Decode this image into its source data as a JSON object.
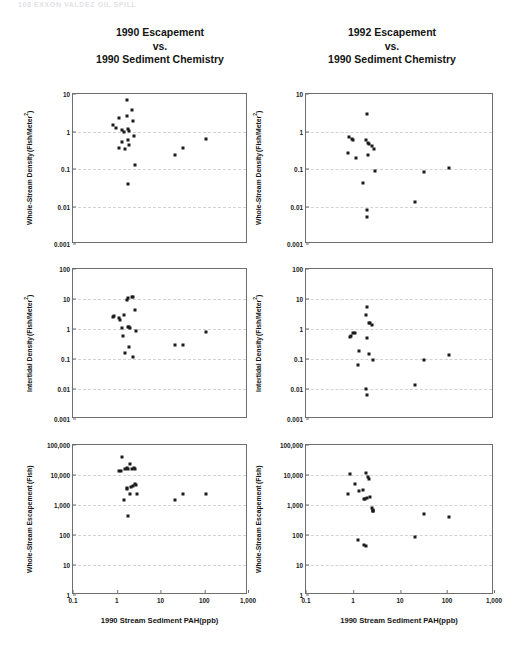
{
  "running_head": "108    EXXON VALDEZ OIL SPILL",
  "columns": [
    {
      "title_lines": [
        "1990 Escapement",
        "vs.",
        "1990  Sediment Chemistry"
      ]
    },
    {
      "title_lines": [
        "1992 Escapement",
        "vs.",
        "1990 Sediment Chemistry"
      ]
    }
  ],
  "axis": {
    "x_label_left": "1990 Stream Sediment PAH(ppb)",
    "x_label_right": "1990 Stream Sediment  PAH(ppb)",
    "x_ticks": [
      "0.1",
      "1",
      "10",
      "100",
      "1,000"
    ],
    "y_ticks_density": [
      "10",
      "1",
      "0.1",
      "0.01",
      "0.001"
    ],
    "y_ticks_intertidal": [
      "100",
      "10",
      "1",
      "0.1",
      "0.01",
      "0.001"
    ],
    "y_ticks_escapement": [
      "100,000",
      "10,000",
      "1,000",
      "100",
      "10",
      "1"
    ]
  },
  "chart_data": [
    {
      "id": "whole-stream-density-1990",
      "type": "scatter",
      "title": "1990 Escapement vs. 1990 Sediment Chemistry",
      "xlabel": "1990 Stream Sediment PAH(ppb)",
      "ylabel": "Whole-Stream Density (Fish/Meter²)",
      "ylabel_line1": "Whole-Stream Density",
      "ylabel_line2": "(Fish/Meter²)",
      "xscale": "log",
      "yscale": "log",
      "xlim": [
        0.1,
        1000
      ],
      "ylim": [
        0.001,
        10
      ],
      "grid": true,
      "points": [
        [
          1.75,
          7.0
        ],
        [
          2.2,
          3.7
        ],
        [
          1.15,
          2.3
        ],
        [
          1.7,
          2.6
        ],
        [
          2.35,
          1.9
        ],
        [
          0.82,
          1.5
        ],
        [
          0.95,
          1.25
        ],
        [
          1.35,
          1.1
        ],
        [
          1.8,
          1.15
        ],
        [
          1.9,
          1.05
        ],
        [
          1.5,
          0.98
        ],
        [
          2.5,
          0.78
        ],
        [
          1.3,
          0.52
        ],
        [
          1.85,
          0.58
        ],
        [
          1.95,
          0.44
        ],
        [
          1.15,
          0.37
        ],
        [
          1.55,
          0.35
        ],
        [
          2.6,
          0.13
        ],
        [
          1.8,
          0.04
        ],
        [
          21.0,
          0.23
        ],
        [
          32.0,
          0.36
        ],
        [
          110.0,
          0.62
        ]
      ]
    },
    {
      "id": "intertidal-density-1990",
      "type": "scatter",
      "title": "1990 Escapement vs. 1990 Sediment Chemistry",
      "xlabel": "1990 Stream Sediment PAH(ppb)",
      "ylabel": "Intertidal Density (Fish/Meter²)",
      "ylabel_line1": "Intertidal Density",
      "ylabel_line2": "(Fish/Meter²)",
      "xscale": "log",
      "yscale": "log",
      "xlim": [
        0.1,
        1000
      ],
      "ylim": [
        0.001,
        100
      ],
      "grid": true,
      "points": [
        [
          1.8,
          10.5
        ],
        [
          1.75,
          9.3
        ],
        [
          2.2,
          11.5
        ],
        [
          2.3,
          11.8
        ],
        [
          2.6,
          4.2
        ],
        [
          0.82,
          2.6
        ],
        [
          0.88,
          2.7
        ],
        [
          1.1,
          2.3
        ],
        [
          1.45,
          2.9
        ],
        [
          1.2,
          1.95
        ],
        [
          1.35,
          1.05
        ],
        [
          1.9,
          1.15
        ],
        [
          2.0,
          1.1
        ],
        [
          1.85,
          1.2
        ],
        [
          2.8,
          0.88
        ],
        [
          1.4,
          0.6
        ],
        [
          1.55,
          0.16
        ],
        [
          1.95,
          0.26
        ],
        [
          2.4,
          0.115
        ],
        [
          21.0,
          0.3
        ],
        [
          32.0,
          0.3
        ],
        [
          110.0,
          0.8
        ]
      ]
    },
    {
      "id": "whole-stream-escapement-1990",
      "type": "scatter",
      "title": "1990 Escapement vs. 1990 Sediment Chemistry",
      "xlabel": "1990 Stream Sediment PAH(ppb)",
      "ylabel": "Whole-Stream Escapement (Fish)",
      "ylabel_line1": "Whole-Stream Escapement",
      "ylabel_line2": "(Fish)",
      "xscale": "log",
      "yscale": "log",
      "xlim": [
        0.1,
        1000
      ],
      "ylim": [
        1,
        100000
      ],
      "grid": true,
      "points": [
        [
          1.35,
          39000
        ],
        [
          2.05,
          24000
        ],
        [
          1.15,
          13500
        ],
        [
          1.25,
          14000
        ],
        [
          1.55,
          16000
        ],
        [
          1.7,
          17500
        ],
        [
          1.85,
          15500
        ],
        [
          2.2,
          16000
        ],
        [
          2.45,
          17000
        ],
        [
          2.55,
          15500
        ],
        [
          1.7,
          3600
        ],
        [
          1.75,
          3400
        ],
        [
          2.1,
          4000
        ],
        [
          2.3,
          4400
        ],
        [
          2.65,
          5000
        ],
        [
          2.7,
          4700
        ],
        [
          2.05,
          2300
        ],
        [
          2.9,
          2350
        ],
        [
          1.5,
          1450
        ],
        [
          1.8,
          420
        ],
        [
          21.0,
          1500
        ],
        [
          32.0,
          2300
        ],
        [
          110.0,
          2250
        ]
      ]
    },
    {
      "id": "whole-stream-density-1992",
      "type": "scatter",
      "title": "1992 Escapement vs. 1990 Sediment Chemistry",
      "xlabel": "1990 Stream Sediment PAH(ppb)",
      "ylabel": "Whole-Stream Density (Fish/Meter²)",
      "ylabel_line1": "Whole-Stream Density",
      "ylabel_line2": "(Fish/Meter²)",
      "xscale": "log",
      "yscale": "log",
      "xlim": [
        0.1,
        1000
      ],
      "ylim": [
        0.001,
        10
      ],
      "grid": true,
      "points": [
        [
          2.0,
          2.9
        ],
        [
          0.82,
          0.72
        ],
        [
          0.95,
          0.62
        ],
        [
          1.02,
          0.6
        ],
        [
          1.9,
          0.58
        ],
        [
          2.1,
          0.5
        ],
        [
          2.2,
          0.46
        ],
        [
          2.5,
          0.42
        ],
        [
          2.75,
          0.35
        ],
        [
          0.78,
          0.26
        ],
        [
          1.15,
          0.2
        ],
        [
          2.05,
          0.23
        ],
        [
          2.95,
          0.088
        ],
        [
          1.6,
          0.043
        ],
        [
          2.0,
          0.0082
        ],
        [
          1.95,
          0.0053
        ],
        [
          21.0,
          0.0128
        ],
        [
          32.0,
          0.081
        ],
        [
          110.0,
          0.107
        ]
      ]
    },
    {
      "id": "intertidal-density-1992",
      "type": "scatter",
      "title": "1992 Escapement vs. 1990 Sediment Chemistry",
      "xlabel": "1990 Stream Sediment PAH(ppb)",
      "ylabel": "Intertidal Density (Fish/Meter²)",
      "ylabel_line1": "Intertidal Density",
      "ylabel_line2": "(Fish/Meter²)",
      "xscale": "log",
      "yscale": "log",
      "xlim": [
        0.1,
        1000
      ],
      "ylim": [
        0.001,
        100
      ],
      "grid": true,
      "points": [
        [
          2.0,
          5.5
        ],
        [
          1.85,
          3.0
        ],
        [
          2.15,
          1.6
        ],
        [
          2.25,
          1.55
        ],
        [
          2.5,
          1.35
        ],
        [
          0.85,
          0.55
        ],
        [
          0.9,
          0.58
        ],
        [
          1.0,
          0.75
        ],
        [
          1.1,
          0.74
        ],
        [
          1.95,
          0.52
        ],
        [
          1.35,
          0.19
        ],
        [
          2.2,
          0.145
        ],
        [
          1.25,
          0.065
        ],
        [
          2.7,
          0.092
        ],
        [
          1.9,
          0.0102
        ],
        [
          2.0,
          0.0061
        ],
        [
          21.0,
          0.0138
        ],
        [
          32.0,
          0.094
        ],
        [
          110.0,
          0.14
        ]
      ]
    },
    {
      "id": "whole-stream-escapement-1992",
      "type": "scatter",
      "title": "1992 Escapement vs. 1990 Sediment Chemistry",
      "xlabel": "1990 Stream Sediment PAH(ppb)",
      "ylabel": "Whole-Stream Escapement (Fish)",
      "ylabel_line1": "Whole-Stream Escapement",
      "ylabel_line2": "(Fish)",
      "xscale": "log",
      "yscale": "log",
      "xlim": [
        0.1,
        1000
      ],
      "ylim": [
        1,
        100000
      ],
      "grid": true,
      "points": [
        [
          0.86,
          11000
        ],
        [
          1.85,
          11500
        ],
        [
          2.1,
          8500
        ],
        [
          2.2,
          7600
        ],
        [
          1.12,
          5200
        ],
        [
          1.35,
          2900
        ],
        [
          1.6,
          3200
        ],
        [
          0.8,
          2400
        ],
        [
          1.75,
          1600
        ],
        [
          1.82,
          1550
        ],
        [
          1.95,
          1750
        ],
        [
          2.3,
          1900
        ],
        [
          2.55,
          800
        ],
        [
          2.6,
          700
        ],
        [
          2.6,
          640
        ],
        [
          2.65,
          620
        ],
        [
          1.3,
          66
        ],
        [
          1.75,
          45
        ],
        [
          1.9,
          44
        ],
        [
          21.0,
          86
        ],
        [
          32.0,
          520
        ],
        [
          110.0,
          410
        ]
      ]
    }
  ]
}
